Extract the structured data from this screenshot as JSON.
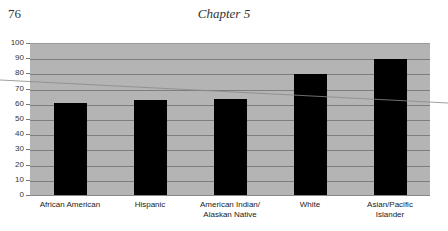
{
  "page": {
    "page_number": "76",
    "running_head": "Chapter 5"
  },
  "chart_data": {
    "type": "bar",
    "title": "",
    "xlabel": "",
    "ylabel": "",
    "categories": [
      "African American",
      "Hispanic",
      "American Indian/ Alaskan Native",
      "White",
      "Asian/Pacific Islander"
    ],
    "category_lines": [
      [
        "African American"
      ],
      [
        "Hispanic"
      ],
      [
        "American Indian/",
        "Alaskan Native"
      ],
      [
        "White"
      ],
      [
        "Asian/Pacific",
        "Islander"
      ]
    ],
    "values": [
      61,
      63,
      64,
      80,
      90
    ],
    "ylim": [
      0,
      100
    ],
    "yticks": [
      0,
      10,
      20,
      30,
      40,
      50,
      60,
      70,
      80,
      90,
      100
    ],
    "grid": true,
    "legend": null,
    "colors": {
      "plot_background": "#b4b4b4",
      "bar": "#000000",
      "gridline": "#7e7e7e"
    }
  }
}
